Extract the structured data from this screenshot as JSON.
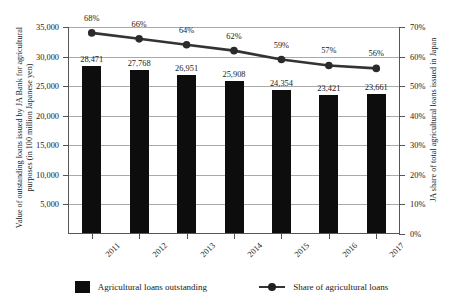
{
  "chart_data": {
    "type": "bar",
    "title": "",
    "subtitle": "",
    "categories": [
      "2011",
      "2012",
      "2013",
      "2014",
      "2015",
      "2016",
      "2017"
    ],
    "xlabel": "",
    "ylabel": "Value of outstanding loans issued by JA Bank for agricultural purposes (in 100 million Japanese yen)",
    "y2label": "JA share of total agricultural loans issued in Japan",
    "ylim": [
      0,
      35000
    ],
    "y2lim": [
      0,
      70
    ],
    "yticks": [
      "5,000",
      "10,000",
      "15,000",
      "20,000",
      "25,000",
      "30,000",
      "35,000"
    ],
    "ytick_values": [
      5000,
      10000,
      15000,
      20000,
      25000,
      30000,
      35000
    ],
    "y2ticks": [
      "0%",
      "10%",
      "20%",
      "30%",
      "40%",
      "50%",
      "60%",
      "70%"
    ],
    "y2tick_values": [
      0,
      10,
      20,
      30,
      40,
      50,
      60,
      70
    ],
    "grid": true,
    "legend_position": "bottom",
    "series": [
      {
        "name": "Agricultural loans outstanding",
        "type": "bar",
        "axis": "left",
        "color": "#0d0d0d",
        "values": [
          28471,
          27768,
          26951,
          25908,
          24354,
          23421,
          23661
        ],
        "labels": [
          "28,471",
          "27,768",
          "26,951",
          "25,908",
          "24,354",
          "23,421",
          "23,661"
        ]
      },
      {
        "name": "Share of agricultural loans",
        "type": "line",
        "axis": "right",
        "color": "#333333",
        "values": [
          68,
          66,
          64,
          62,
          59,
          57,
          56
        ],
        "labels": [
          "68%",
          "66%",
          "64%",
          "62%",
          "59%",
          "57%",
          "56%"
        ]
      }
    ]
  },
  "legend": {
    "items": [
      {
        "label": "Agricultural loans outstanding",
        "marker": "square-swatch"
      },
      {
        "label": "Share of agricultural loans",
        "marker": "line-with-dot"
      }
    ]
  },
  "colors": {
    "bar": "#0d0d0d",
    "line": "#333333",
    "grid": "#aaaaaa",
    "axis": "#555555",
    "text": "#1a1a1a",
    "background": "#ffffff"
  }
}
